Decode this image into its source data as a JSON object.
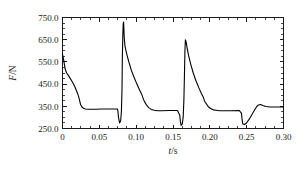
{
  "figure": {
    "background_color": "#ffffff",
    "line_color": "#000000",
    "axis_color": "#1a1a1a"
  },
  "chart_data": {
    "type": "line",
    "title": "",
    "subtitle": "",
    "xlabel": "t/s",
    "ylabel": "F/N",
    "xlabel_italic_part": "t",
    "xlabel_rest": "/s",
    "ylabel_italic_part": "F",
    "ylabel_rest": "/N",
    "xlim": [
      0.0,
      0.3
    ],
    "ylim": [
      250.0,
      750.0
    ],
    "grid": false,
    "legend": null,
    "legend_position": "none",
    "xticks": [
      0.0,
      0.05,
      0.1,
      0.15,
      0.2,
      0.25,
      0.3
    ],
    "xtick_labels": [
      "0",
      "0.05",
      "0.10",
      "0.15",
      "0.20",
      "0.25",
      "0.30"
    ],
    "xminor_interval": 0.0125,
    "yticks": [
      250.0,
      350.0,
      450.0,
      550.0,
      650.0,
      750.0
    ],
    "ytick_labels": [
      "250.0",
      "350.0",
      "450.0",
      "550.0",
      "650.0",
      "750.0"
    ],
    "yminor_interval": 25.0,
    "series": [
      {
        "name": "force",
        "x": [
          0.0,
          0.0015,
          0.0035,
          0.0055,
          0.0075,
          0.01,
          0.013,
          0.016,
          0.019,
          0.0215,
          0.023,
          0.0238,
          0.0245,
          0.0262,
          0.0285,
          0.031,
          0.0345,
          0.0385,
          0.043,
          0.047,
          0.052,
          0.06,
          0.07,
          0.0745,
          0.0752,
          0.076,
          0.0775,
          0.079,
          0.08,
          0.0808,
          0.0812,
          0.0818,
          0.0824,
          0.083,
          0.0838,
          0.0848,
          0.0862,
          0.088,
          0.0905,
          0.0935,
          0.097,
          0.101,
          0.1045,
          0.107,
          0.1082,
          0.109,
          0.1098,
          0.1115,
          0.114,
          0.117,
          0.1205,
          0.1245,
          0.129,
          0.135,
          0.145,
          0.156,
          0.1592,
          0.16,
          0.161,
          0.1625,
          0.1638,
          0.1648,
          0.1656,
          0.1662,
          0.1668,
          0.1678,
          0.1692,
          0.1712,
          0.174,
          0.1775,
          0.181,
          0.185,
          0.1885,
          0.191,
          0.192,
          0.1928,
          0.1938,
          0.1955,
          0.198,
          0.201,
          0.2045,
          0.2085,
          0.213,
          0.219,
          0.228,
          0.24,
          0.243,
          0.2438,
          0.2448,
          0.247,
          0.25,
          0.2535,
          0.257,
          0.2605,
          0.2635,
          0.266,
          0.269,
          0.272,
          0.276,
          0.282,
          0.29,
          0.3
        ],
        "y": [
          585,
          560,
          520,
          500,
          492,
          478,
          462,
          444,
          420,
          398,
          380,
          368,
          358,
          348,
          341,
          338,
          337,
          337,
          337,
          337,
          338,
          338,
          338,
          338,
          330,
          300,
          275,
          285,
          330,
          430,
          560,
          660,
          722,
          730,
          660,
          622,
          600,
          575,
          545,
          512,
          482,
          450,
          425,
          408,
          398,
          390,
          382,
          370,
          356,
          344,
          336,
          332,
          330,
          330,
          331,
          331,
          310,
          282,
          264,
          270,
          300,
          380,
          500,
          600,
          650,
          640,
          612,
          578,
          540,
          500,
          466,
          434,
          408,
          392,
          382,
          374,
          368,
          360,
          348,
          340,
          334,
          332,
          330,
          330,
          330,
          331,
          318,
          290,
          270,
          268,
          276,
          292,
          312,
          332,
          348,
          356,
          358,
          354,
          349,
          347,
          347,
          347
        ]
      }
    ],
    "annotations": [],
    "features": {
      "baseline_level": 337,
      "major_spike_peaks": [
        730,
        650
      ],
      "minor_spike_peaks": [
        485,
        468,
        440
      ],
      "minimum_troughs": [
        264,
        268,
        275
      ],
      "starting_value": 585
    }
  }
}
